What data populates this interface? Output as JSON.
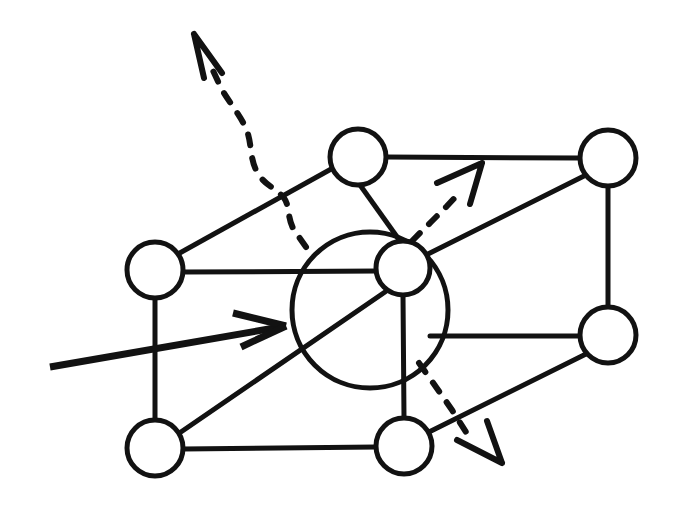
{
  "figure": {
    "background_color": "#ffffff",
    "ink_color": "#121212",
    "width": 676,
    "height": 508
  },
  "geometry": {
    "lattice_nodes": [
      {
        "name": "node-top-middle",
        "cx": 358,
        "cy": 157,
        "r": 28,
        "stroke_width": 5
      },
      {
        "name": "node-top-right",
        "cx": 608,
        "cy": 158,
        "r": 28,
        "stroke_width": 5
      },
      {
        "name": "node-left-middle",
        "cx": 155,
        "cy": 270,
        "r": 28,
        "stroke_width": 5
      },
      {
        "name": "node-center-small",
        "cx": 403,
        "cy": 268,
        "r": 27,
        "stroke_width": 5
      },
      {
        "name": "node-right-middle",
        "cx": 608,
        "cy": 335,
        "r": 28,
        "stroke_width": 5
      },
      {
        "name": "node-bottom-left",
        "cx": 155,
        "cy": 448,
        "r": 28,
        "stroke_width": 5
      },
      {
        "name": "node-bottom-middle",
        "cx": 404,
        "cy": 446,
        "r": 28,
        "stroke_width": 5
      }
    ],
    "vacancy_circle": {
      "name": "vacancy-large-circle",
      "cx": 370,
      "cy": 310,
      "r": 78,
      "stroke_width": 5
    },
    "bonds": [
      {
        "name": "bond-top-middle-to-top-right",
        "x1": 386,
        "y1": 157,
        "x2": 580,
        "y2": 158,
        "stroke_width": 5
      },
      {
        "name": "bond-top-middle-to-center",
        "x1": 360,
        "y1": 185,
        "x2": 400,
        "y2": 241,
        "stroke_width": 5
      },
      {
        "name": "bond-left-middle-to-top-middle",
        "x1": 178,
        "y1": 254,
        "x2": 333,
        "y2": 168,
        "stroke_width": 5
      },
      {
        "name": "bond-left-middle-to-center",
        "x1": 183,
        "y1": 272,
        "x2": 378,
        "y2": 271,
        "stroke_width": 5
      },
      {
        "name": "bond-left-middle-to-bottom-left",
        "x1": 155,
        "y1": 298,
        "x2": 155,
        "y2": 420,
        "stroke_width": 5
      },
      {
        "name": "bond-center-to-top-right",
        "x1": 426,
        "y1": 255,
        "x2": 586,
        "y2": 175,
        "stroke_width": 5
      },
      {
        "name": "bond-top-right-to-right-middle",
        "x1": 608,
        "y1": 186,
        "x2": 608,
        "y2": 307,
        "stroke_width": 5
      },
      {
        "name": "bond-center-to-right-middle",
        "x1": 430,
        "y1": 336,
        "x2": 580,
        "y2": 336,
        "stroke_width": 5
      },
      {
        "name": "bond-center-to-bottom-middle",
        "x1": 403,
        "y1": 295,
        "x2": 404,
        "y2": 418,
        "stroke_width": 5
      },
      {
        "name": "bond-bottom-left-to-center",
        "x1": 178,
        "y1": 434,
        "x2": 385,
        "y2": 292,
        "stroke_width": 5
      },
      {
        "name": "bond-bottom-left-to-bottom-middle",
        "x1": 183,
        "y1": 449,
        "x2": 376,
        "y2": 447,
        "stroke_width": 5
      },
      {
        "name": "bond-bottom-middle-to-right-middle",
        "x1": 429,
        "y1": 432,
        "x2": 588,
        "y2": 353,
        "stroke_width": 5
      }
    ],
    "incoming_arrow": {
      "name": "incoming-particle-arrow",
      "shaft": {
        "x1": 50,
        "y1": 367,
        "x2": 286,
        "y2": 326
      },
      "head": [
        {
          "x1": 286,
          "y1": 326,
          "x2": 233,
          "y2": 313
        },
        {
          "x1": 286,
          "y1": 326,
          "x2": 241,
          "y2": 347
        }
      ],
      "stroke_width": 7
    },
    "dashed_arrows": [
      {
        "name": "scattered-arrow-upper-left",
        "path": "M 306 247 L 294 230 C 287 218 290 206 284 198 C 276 188 266 186 259 175 C 250 162 252 148 248 134 C 243 118 230 104 221 88 L 209 62",
        "head": "M 194 34 L 204 78 M 194 34 L 222 73",
        "stroke_width": 6,
        "dash": "11 13"
      },
      {
        "name": "scattered-arrow-upper-right",
        "path": "M 412 241 L 431 222 L 447 206 L 462 190",
        "head": "M 482 163 L 437 183 M 482 163 L 470 204",
        "stroke_width": 6,
        "dash": "11 13"
      },
      {
        "name": "scattered-arrow-lower-right",
        "path": "M 419 363 L 436 387 L 452 410 L 466 432",
        "head": "M 502 463 L 457 440 M 502 463 L 487 421",
        "stroke_width": 6,
        "dash": "11 13"
      }
    ]
  },
  "legend": {
    "incoming_label": "incident particle",
    "vacancy_label": "vacancy",
    "scattered_label": "scattered waves"
  }
}
